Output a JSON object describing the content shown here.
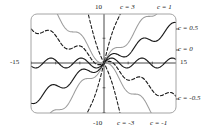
{
  "figure": {
    "type": "plot",
    "frame": {
      "x0": 31,
      "y0": 14,
      "x1": 176,
      "y1": 113,
      "corner_radius": 6,
      "stroke": "#9a9a9a"
    },
    "origin": {
      "x": 104,
      "y": 63
    },
    "axes": {
      "x_label_left": "-15",
      "x_label_right": "15",
      "y_label_top": "10",
      "y_label_bottom": "-10",
      "xlim": [
        -15,
        15
      ],
      "ylim": [
        -10,
        10
      ],
      "grid": false,
      "axis_color": "#333333"
    },
    "colors": {
      "black": "#1a1a1a",
      "gray": "#9d9d9d",
      "frame": "#9a9a9a",
      "axis": "#333333",
      "label": "#1a1a1a"
    },
    "curve_labels": [
      {
        "id": "c-3",
        "text": "c = 3",
        "x": 120,
        "y": 4,
        "anchor": "start"
      },
      {
        "id": "c-1",
        "text": "c = 1",
        "x": 157,
        "y": 4,
        "anchor": "start"
      },
      {
        "id": "c-0p5",
        "text": "c = 0.5",
        "x": 178,
        "y": 25,
        "anchor": "start"
      },
      {
        "id": "c-0",
        "text": "c = 0",
        "x": 178,
        "y": 46,
        "anchor": "start"
      },
      {
        "id": "c-m0p5",
        "text": "c = -0.5",
        "x": 178,
        "y": 95,
        "anchor": "start"
      },
      {
        "id": "c-m3",
        "text": "c = -3",
        "x": 117,
        "y": 120,
        "anchor": "start"
      },
      {
        "id": "c-m1",
        "text": "c = -1",
        "x": 150,
        "y": 120,
        "anchor": "start"
      }
    ],
    "axis_tick_labels": [
      {
        "id": "y-top",
        "text": "10",
        "x": 95,
        "y": 4
      },
      {
        "id": "y-bottom",
        "text": "-10",
        "x": 93,
        "y": 120
      },
      {
        "id": "x-left",
        "text": "-15",
        "x": 10,
        "y": 59
      },
      {
        "id": "x-right",
        "text": "15",
        "x": 180,
        "y": 59
      }
    ]
  },
  "chart_data": {
    "type": "line",
    "title": "",
    "xlabel": "",
    "ylabel": "",
    "xlim": [
      -15,
      15
    ],
    "ylim": [
      -10,
      10
    ],
    "grid": false,
    "legend_position": "inline-annotations",
    "function": "y = c*x + sin(x)",
    "series": [
      {
        "name": "c = 3",
        "c": 3,
        "color": "#1a1a1a",
        "style": "dashed"
      },
      {
        "name": "c = 1",
        "c": 1,
        "color": "#9d9d9d",
        "style": "solid"
      },
      {
        "name": "c = 0.5",
        "c": 0.5,
        "color": "#1a1a1a",
        "style": "solid"
      },
      {
        "name": "c = 0",
        "c": 0,
        "color": "#1a1a1a",
        "style": "solid"
      },
      {
        "name": "c = -0.5",
        "c": -0.5,
        "color": "#1a1a1a",
        "style": "dashed"
      },
      {
        "name": "c = -1",
        "c": -1,
        "color": "#9d9d9d",
        "style": "solid"
      },
      {
        "name": "c = -3",
        "c": -3,
        "color": "#1a1a1a",
        "style": "dashed"
      }
    ]
  }
}
